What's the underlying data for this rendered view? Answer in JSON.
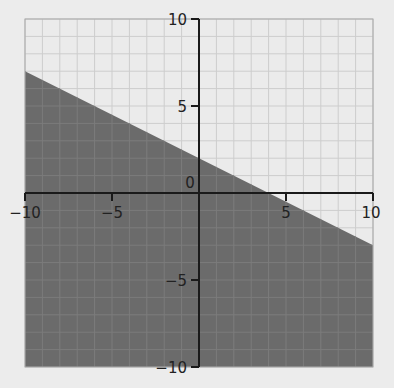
{
  "chart_data": {
    "type": "area",
    "title": "",
    "xlabel": "",
    "ylabel": "",
    "boundary_line": {
      "slope": -0.5,
      "intercept": 2,
      "style": "solid"
    },
    "inequality": "y ≤ -1/2 x + 2",
    "shaded_region": "below",
    "series": [
      {
        "name": "boundary",
        "x": [
          -10,
          10
        ],
        "y": [
          7,
          -3
        ]
      }
    ],
    "xlim": [
      -10,
      10
    ],
    "ylim": [
      -10,
      10
    ],
    "x_ticks": [
      -10,
      -5,
      0,
      5,
      10
    ],
    "y_ticks": [
      -10,
      -5,
      5,
      10
    ],
    "x_tick_labels": [
      "−10",
      "−5",
      "0",
      "5",
      "10"
    ],
    "y_tick_labels": [
      "−10",
      "−5",
      "5",
      "10"
    ],
    "origin_label": "0",
    "grid": true,
    "grid_step": 1,
    "legend": null
  },
  "colors": {
    "background": "#ececec",
    "plot_background": "#ebebeb",
    "shaded": "#6b6b6b",
    "grid_light": "#cdcdcd",
    "grid_dark": "#7c7c7c",
    "axis": "#1a1a1a"
  }
}
